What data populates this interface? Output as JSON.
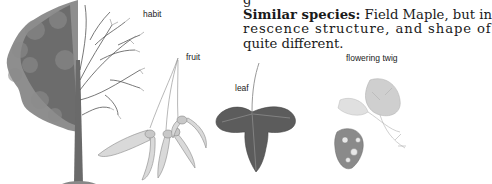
{
  "description": {
    "line0_fragment": "g",
    "heading": "Similar species:",
    "line1_rest": " Field Maple, but in",
    "line2": "rescence structure, and shape of",
    "line3": "quite different."
  },
  "labels": {
    "habit": "habit",
    "fruit": "fruit",
    "leaf": "leaf",
    "flowering_twig": "flowering twig"
  },
  "illustrations": [
    {
      "name": "habit",
      "subject": "tree-half-leafy-half-bare"
    },
    {
      "name": "fruit",
      "subject": "winged-samaras-cluster"
    },
    {
      "name": "leaf",
      "subject": "three-lobed-leaf"
    },
    {
      "name": "flowering-twig",
      "subject": "twig-with-leaves-and-flowers"
    }
  ],
  "colors": {
    "text": "#1a1a1a",
    "foliage": "#6b6b6b",
    "leaf": "#5a5a5a",
    "light_sketch": "#bdbdbd"
  }
}
